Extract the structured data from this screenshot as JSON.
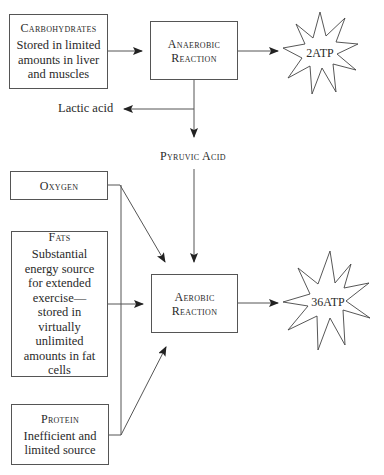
{
  "diagram": {
    "sources": {
      "carbohydrates": {
        "title": "Carbohydrates",
        "description": "Stored in limited amounts in liver and muscles"
      },
      "oxygen": {
        "title": "Oxygen"
      },
      "fats": {
        "title": "Fats",
        "description": "Substantial energy source for extended exercise—stored in virtually unlimited amounts in fat cells"
      },
      "protein": {
        "title": "Protein",
        "description": "Inefficient and limited source"
      }
    },
    "processes": {
      "anaerobic": {
        "line1": "Anaerobic",
        "line2": "Reaction"
      },
      "aerobic": {
        "line1": "Aerobic",
        "line2": "Reaction"
      }
    },
    "intermediates": {
      "lactic_acid": "Lactic acid",
      "pyruvic_acid": "Pyruvic Acid"
    },
    "outputs": {
      "anaerobic_atp": "2ATP",
      "aerobic_atp": "36ATP"
    },
    "colors": {
      "line": "#555555",
      "arrowhead": "#222222",
      "text": "#2a2a2a"
    }
  }
}
